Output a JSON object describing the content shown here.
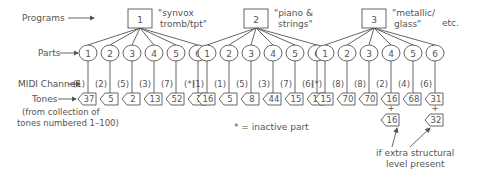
{
  "labels": {
    "programs": "Programs",
    "parts": "Parts",
    "midi_channel": "MIDI Channel",
    "tones": "Tones",
    "tones_note_line1": "(from collection of",
    "tones_note_line2": "tones  numbered 1–100)",
    "inactive_legend": "* = inactive part",
    "etc": "etc.",
    "extra_level_line1": "if extra structural",
    "extra_level_line2": "level present"
  },
  "programs": [
    {
      "number": "1",
      "name_line1": "\"synvox",
      "name_line2": "tromb/tpt\"",
      "parts": [
        "1",
        "2",
        "3",
        "4",
        "5",
        "6"
      ],
      "channels": [
        "(1)",
        "(2)",
        "(5)",
        "(3)",
        "(7)",
        "(*)"
      ],
      "tones": [
        "37",
        "5",
        "2",
        "13",
        "52",
        "1"
      ]
    },
    {
      "number": "2",
      "name_line1": "\"piano &",
      "name_line2": "strings\"",
      "parts": [
        "1",
        "2",
        "3",
        "4",
        "5",
        "6"
      ],
      "channels": [
        "(1)",
        "(1)",
        "(5)",
        "(3)",
        "(7)",
        "(6)"
      ],
      "tones": [
        "16",
        "5",
        "8",
        "44",
        "15",
        "15"
      ]
    },
    {
      "number": "3",
      "name_line1": "\"metallic/",
      "name_line2": "glass\"",
      "parts": [
        "1",
        "2",
        "3",
        "4",
        "5",
        "6"
      ],
      "channels": [
        "(*)",
        "(8)",
        "(8)",
        "(2)",
        "(4)",
        "(6)"
      ],
      "tones": [
        "15",
        "70",
        "70",
        "16",
        "68",
        "31"
      ],
      "extra_tones": [
        {
          "part_index": 3,
          "value": "16"
        },
        {
          "part_index": 5,
          "value": "32"
        }
      ]
    }
  ],
  "plus_sign": "+"
}
